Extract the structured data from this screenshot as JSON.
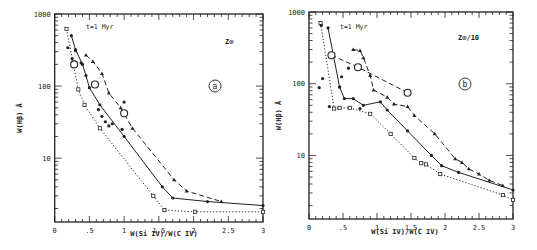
{
  "figure": {
    "panels": [
      "a",
      "b"
    ]
  },
  "chart_data": [
    {
      "type": "line",
      "panel_label": "a",
      "annotation_time": "t=1 Myr",
      "annotation_metallicity": "Z⊙",
      "xlabel": "W(Si IV)/W(C IV)",
      "ylabel": "W(Hβ) Å",
      "xlim": [
        0,
        3
      ],
      "ylim": [
        1.3,
        1000
      ],
      "yscale": "log",
      "x_ticks": [
        "0",
        ".5",
        "1",
        "1.5",
        "2",
        "2.5",
        "3"
      ],
      "y_ticks": [
        "1000",
        "100",
        "10"
      ],
      "grid": false,
      "series": [
        {
          "name": "solid",
          "style": "solid",
          "marker": "dot",
          "x": [
            0.24,
            0.3,
            0.4,
            0.45,
            0.5,
            0.65,
            1.0,
            1.55,
            1.7,
            2.2,
            3.0
          ],
          "y": [
            500,
            320,
            200,
            140,
            95,
            55,
            20,
            4.0,
            2.8,
            2.5,
            2.2
          ]
        },
        {
          "name": "dashed",
          "style": "dashed",
          "marker": "triangle",
          "x": [
            0.45,
            0.55,
            0.68,
            0.78,
            0.95,
            1.12,
            1.72,
            1.9,
            2.4
          ],
          "y": [
            270,
            220,
            150,
            80,
            50,
            26,
            5.0,
            3.5,
            2.5
          ]
        },
        {
          "name": "dotted",
          "style": "dotted",
          "marker": "square",
          "x": [
            0.17,
            0.34,
            0.43,
            0.65,
            1.42,
            1.58,
            2.02,
            3.0
          ],
          "y": [
            620,
            90,
            55,
            26,
            3.0,
            1.9,
            1.8,
            1.8
          ]
        },
        {
          "name": "scatter-filled",
          "style": "none",
          "marker": "dot",
          "x": [
            0.19,
            0.25,
            0.3,
            0.38,
            0.63,
            0.68,
            0.73,
            0.78,
            0.83,
            0.97,
            1.0
          ],
          "y": [
            340,
            240,
            310,
            210,
            47,
            38,
            32,
            28,
            30,
            25,
            60
          ]
        },
        {
          "name": "open-circles",
          "style": "none",
          "marker": "circle",
          "x": [
            0.28,
            0.58,
            1.0
          ],
          "y": [
            200,
            105,
            42
          ]
        }
      ]
    },
    {
      "type": "line",
      "panel_label": "b",
      "annotation_time": "t=1 Myr",
      "annotation_metallicity": "Z⊙/10",
      "xlabel": "W(Si IV)/W(C IV)",
      "ylabel": "W(Hβ) Å",
      "xlim": [
        0,
        3
      ],
      "ylim": [
        1.3,
        1000
      ],
      "yscale": "log",
      "x_ticks": [
        "0",
        ".5",
        "1",
        "1.5",
        "2",
        "2.5",
        "3"
      ],
      "y_ticks": [
        "1000",
        "100",
        "10"
      ],
      "grid": false,
      "series": [
        {
          "name": "solid",
          "style": "solid",
          "marker": "dot",
          "x": [
            0.28,
            0.45,
            0.52,
            0.65,
            0.8,
            1.05,
            1.15,
            1.45,
            1.8,
            1.95,
            2.2,
            3.0
          ],
          "y": [
            600,
            90,
            62,
            62,
            50,
            56,
            43,
            22,
            10,
            7.2,
            5.8,
            3.3
          ]
        },
        {
          "name": "dashed",
          "style": "dashed",
          "marker": "triangle",
          "x": [
            0.65,
            0.75,
            0.8,
            0.9,
            0.95,
            1.15,
            1.25,
            1.45,
            1.55,
            1.85,
            2.15,
            2.25,
            2.35,
            2.5,
            2.65,
            2.85
          ],
          "y": [
            300,
            290,
            230,
            130,
            82,
            65,
            52,
            48,
            36,
            20,
            9.0,
            8.0,
            6.5,
            5.5,
            4.5,
            3.8
          ]
        },
        {
          "name": "dotted",
          "style": "dotted",
          "marker": "square",
          "x": [
            0.17,
            0.37,
            0.45,
            0.6,
            0.9,
            1.2,
            1.55,
            1.65,
            1.72,
            1.93,
            2.85,
            3.0
          ],
          "y": [
            700,
            45,
            46,
            46,
            38,
            20,
            9.2,
            7.8,
            7.5,
            5.5,
            2.8,
            2.4
          ]
        },
        {
          "name": "dash-dot-upper",
          "style": "dashed",
          "marker": "dot",
          "x": [
            0.33,
            0.72,
            1.45
          ],
          "y": [
            250,
            170,
            75
          ]
        },
        {
          "name": "scatter-filled",
          "style": "none",
          "marker": "dot",
          "x": [
            0.15,
            0.2,
            0.18,
            0.3,
            0.45,
            0.48,
            0.58,
            0.75
          ],
          "y": [
            88,
            118,
            650,
            48,
            90,
            125,
            165,
            45
          ]
        },
        {
          "name": "open-circles",
          "style": "none",
          "marker": "circle",
          "x": [
            0.33,
            0.72,
            1.45
          ],
          "y": [
            250,
            170,
            75
          ]
        }
      ]
    }
  ]
}
